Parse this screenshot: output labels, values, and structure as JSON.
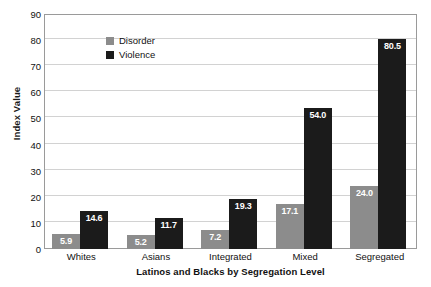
{
  "chart_data": {
    "type": "bar",
    "title": "",
    "xlabel": "Latinos and Blacks by Segregation Level",
    "ylabel": "Index Value",
    "categories": [
      "Whites",
      "Asians",
      "Integrated",
      "Mixed",
      "Segregated"
    ],
    "series": [
      {
        "name": "Disorder",
        "color": "#8c8c8c",
        "values": [
          5.9,
          5.2,
          7.2,
          17.1,
          24.0
        ]
      },
      {
        "name": "Violence",
        "color": "#1b1b1b",
        "values": [
          14.6,
          11.7,
          19.3,
          54.0,
          80.5
        ]
      }
    ],
    "value_labels": {
      "Disorder": [
        "5.9",
        "5.2",
        "7.2",
        "17.1",
        "24.0"
      ],
      "Violence": [
        "14.6",
        "11.7",
        "19.3",
        "54.0",
        "80.5"
      ]
    },
    "ylim": [
      0,
      90
    ],
    "yticks": [
      90,
      80,
      70,
      60,
      50,
      40,
      30,
      20,
      10,
      0
    ],
    "ytick_labels": [
      "90",
      "80",
      "70",
      "60",
      "50",
      "40",
      "30",
      "20",
      "10",
      "0"
    ],
    "grid": true,
    "legend_position": "top-left",
    "legend": [
      "Disorder",
      "Violence"
    ]
  }
}
